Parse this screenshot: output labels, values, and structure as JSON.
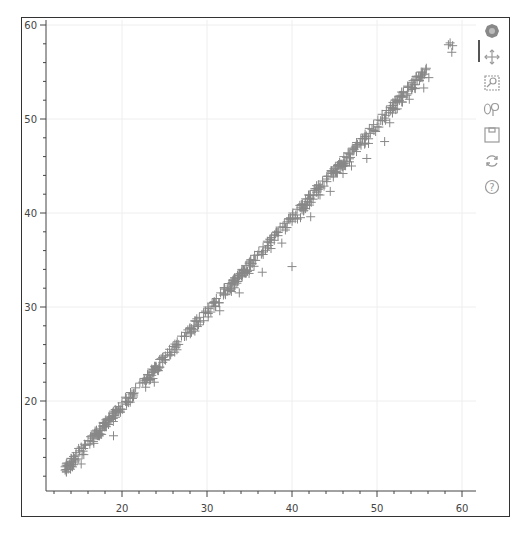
{
  "chart_data": {
    "type": "scatter",
    "title": "",
    "xlabel": "",
    "ylabel": "",
    "marker": "cross",
    "marker_color": "#888888",
    "grid": true,
    "xlim": [
      11.1,
      61.6
    ],
    "ylim": [
      10.5,
      61.6
    ],
    "x_ticks": [
      20,
      30,
      40,
      50,
      60
    ],
    "y_ticks": [
      20,
      30,
      40,
      50,
      60
    ],
    "x_tick_labels": [
      "20",
      "30",
      "40",
      "50",
      "60"
    ],
    "y_tick_labels": [
      "20",
      "30",
      "40",
      "50",
      "60"
    ],
    "trend": "points lie tightly along y = x from ~13 to ~58, with a few outliers below the line",
    "points": [
      [
        13.3,
        13.0
      ],
      [
        13.5,
        13.4
      ],
      [
        13.8,
        13.2
      ],
      [
        14.0,
        13.9
      ],
      [
        14.3,
        14.1
      ],
      [
        14.6,
        14.5
      ],
      [
        15.0,
        14.7
      ],
      [
        15.2,
        15.1
      ],
      [
        15.6,
        15.4
      ],
      [
        16.0,
        15.8
      ],
      [
        16.3,
        16.2
      ],
      [
        16.7,
        16.4
      ],
      [
        17.0,
        16.9
      ],
      [
        17.4,
        17.1
      ],
      [
        17.8,
        17.6
      ],
      [
        18.1,
        18.0
      ],
      [
        18.5,
        18.3
      ],
      [
        18.9,
        18.7
      ],
      [
        19.2,
        19.1
      ],
      [
        19.6,
        19.4
      ],
      [
        20.0,
        19.8
      ],
      [
        20.5,
        20.3
      ],
      [
        21.0,
        20.9
      ],
      [
        21.6,
        21.4
      ],
      [
        22.1,
        21.9
      ],
      [
        22.6,
        22.4
      ],
      [
        23.0,
        22.8
      ],
      [
        23.5,
        23.4
      ],
      [
        24.0,
        23.7
      ],
      [
        24.6,
        24.5
      ],
      [
        25.1,
        24.8
      ],
      [
        25.6,
        25.5
      ],
      [
        26.0,
        25.8
      ],
      [
        26.5,
        26.3
      ],
      [
        27.0,
        26.9
      ],
      [
        27.5,
        27.3
      ],
      [
        28.0,
        27.8
      ],
      [
        28.6,
        28.5
      ],
      [
        29.1,
        28.9
      ],
      [
        29.6,
        29.4
      ],
      [
        30.1,
        30.0
      ],
      [
        30.6,
        30.4
      ],
      [
        31.1,
        30.9
      ],
      [
        31.6,
        31.5
      ],
      [
        32.1,
        31.9
      ],
      [
        32.6,
        32.5
      ],
      [
        33.1,
        32.9
      ],
      [
        33.6,
        33.4
      ],
      [
        34.1,
        34.0
      ],
      [
        34.6,
        34.4
      ],
      [
        35.1,
        34.9
      ],
      [
        35.6,
        35.5
      ],
      [
        36.1,
        35.9
      ],
      [
        36.6,
        36.4
      ],
      [
        37.1,
        37.0
      ],
      [
        37.6,
        37.4
      ],
      [
        38.1,
        37.9
      ],
      [
        38.6,
        38.5
      ],
      [
        39.1,
        38.9
      ],
      [
        39.6,
        39.4
      ],
      [
        40.1,
        40.0
      ],
      [
        40.6,
        40.4
      ],
      [
        41.1,
        40.9
      ],
      [
        41.6,
        41.5
      ],
      [
        42.1,
        41.9
      ],
      [
        42.6,
        42.4
      ],
      [
        43.1,
        43.0
      ],
      [
        43.6,
        43.4
      ],
      [
        44.1,
        43.9
      ],
      [
        44.6,
        44.5
      ],
      [
        45.1,
        44.9
      ],
      [
        45.6,
        45.4
      ],
      [
        46.1,
        46.0
      ],
      [
        46.6,
        46.4
      ],
      [
        47.1,
        46.9
      ],
      [
        47.6,
        47.5
      ],
      [
        48.1,
        47.9
      ],
      [
        48.6,
        48.4
      ],
      [
        49.1,
        49.0
      ],
      [
        49.6,
        49.4
      ],
      [
        50.1,
        49.9
      ],
      [
        50.6,
        50.5
      ],
      [
        51.1,
        50.9
      ],
      [
        51.6,
        51.4
      ],
      [
        52.1,
        52.0
      ],
      [
        52.6,
        52.4
      ],
      [
        53.1,
        52.9
      ],
      [
        53.6,
        53.5
      ],
      [
        54.1,
        53.9
      ],
      [
        54.6,
        54.5
      ],
      [
        55.2,
        55.0
      ],
      [
        55.8,
        55.4
      ],
      [
        58.6,
        58.1
      ],
      [
        58.9,
        57.8
      ],
      [
        58.4,
        57.9
      ],
      [
        58.8,
        57.1
      ],
      [
        19.0,
        16.3
      ],
      [
        15.2,
        13.3
      ],
      [
        23.8,
        22.0
      ],
      [
        26.2,
        25.2
      ],
      [
        31.5,
        29.6
      ],
      [
        33.8,
        31.5
      ],
      [
        36.5,
        33.7
      ],
      [
        40.0,
        34.3
      ],
      [
        38.8,
        36.8
      ],
      [
        42.2,
        39.6
      ],
      [
        44.5,
        42.3
      ],
      [
        47.0,
        45.0
      ],
      [
        48.8,
        45.8
      ],
      [
        50.9,
        47.6
      ],
      [
        52.2,
        51.0
      ],
      [
        53.8,
        52.1
      ],
      [
        55.5,
        53.3
      ],
      [
        56.1,
        54.4
      ],
      [
        29.0,
        28.1
      ],
      [
        35.0,
        33.9
      ],
      [
        41.0,
        39.5
      ],
      [
        46.0,
        44.2
      ],
      [
        49.0,
        47.4
      ],
      [
        51.5,
        49.6
      ],
      [
        53.0,
        51.8
      ]
    ]
  },
  "toolbar": {
    "tools": [
      {
        "name": "bokeh-logo-icon",
        "tooltip": ""
      },
      {
        "name": "pan-icon",
        "tooltip": ""
      },
      {
        "name": "box-zoom-icon",
        "tooltip": ""
      },
      {
        "name": "wheel-zoom-icon",
        "tooltip": ""
      },
      {
        "name": "save-icon",
        "tooltip": ""
      },
      {
        "name": "reset-icon",
        "tooltip": ""
      },
      {
        "name": "help-icon",
        "tooltip": ""
      }
    ]
  }
}
